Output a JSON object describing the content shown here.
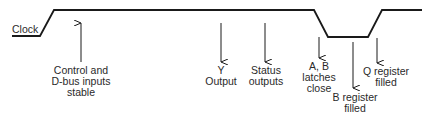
{
  "diagram": {
    "signal_label": "Clock",
    "events": [
      {
        "id": "control",
        "lines": [
          "Control and",
          "D-bus inputs",
          "stable"
        ],
        "direction": "up"
      },
      {
        "id": "y-output",
        "lines": [
          "Y",
          "Output"
        ],
        "direction": "down"
      },
      {
        "id": "status",
        "lines": [
          "Status",
          "outputs"
        ],
        "direction": "down"
      },
      {
        "id": "ab-latches",
        "lines": [
          "A, B",
          "latches",
          "close"
        ],
        "direction": "down"
      },
      {
        "id": "b-register",
        "lines": [
          "B register",
          "filled"
        ],
        "direction": "down"
      },
      {
        "id": "q-register",
        "lines": [
          "Q register",
          "filled"
        ],
        "direction": "down"
      }
    ],
    "colors": {
      "line": "#1a1a1a",
      "text": "#2a2a2a",
      "background": "#ffffff"
    }
  }
}
